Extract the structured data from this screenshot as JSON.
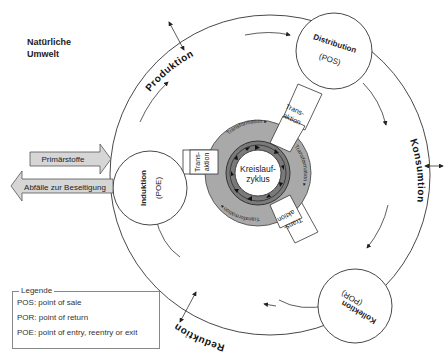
{
  "environment_label": "Natürliche Umwelt",
  "outer_cycle": {
    "phases": [
      "Produktion",
      "Konsumtion",
      "Reduktion"
    ]
  },
  "nodes": {
    "induktion": {
      "name": "Induktion",
      "code": "(POE)"
    },
    "distribution": {
      "name": "Distribution",
      "code": "(POS)"
    },
    "kollektion": {
      "name": "Kollektion",
      "code": "(POR)"
    }
  },
  "center": {
    "line1": "Kreislauf-",
    "line2": "zyklus"
  },
  "connectors": {
    "line1": "Trans-",
    "line2": "aktion"
  },
  "ring_label": "Transformation",
  "flows": {
    "in": "Primärstoffe",
    "out": "Abfälle zur Beseitigung"
  },
  "legend": {
    "title": "Legende",
    "items": [
      "POS: point of sale",
      "POR: point of return",
      "POE: point of entry, reentry or exit"
    ]
  },
  "colors": {
    "ring_light": "#a9a9a9",
    "ring_dark": "#7a7a7a",
    "arrow_fill": "#d6d6d6",
    "stroke": "#333333"
  }
}
